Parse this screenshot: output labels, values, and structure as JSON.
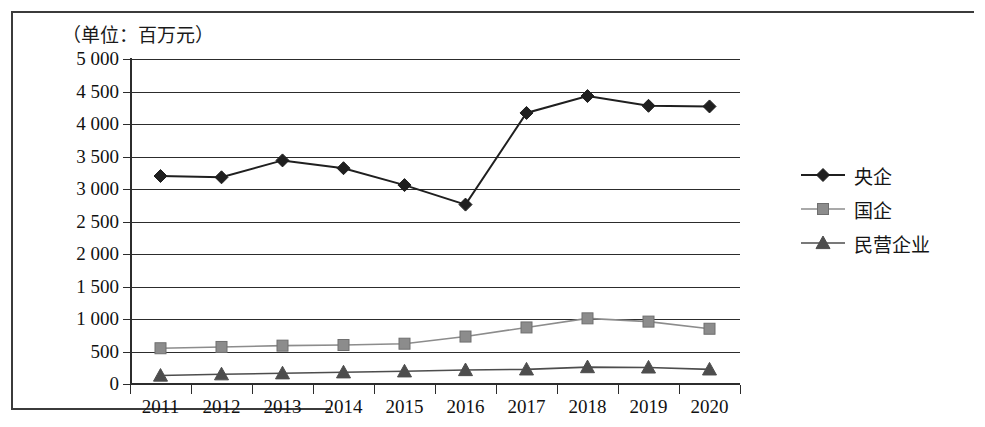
{
  "figure": {
    "unit_label": "（单位：百万元）"
  },
  "legend": {
    "position": "right",
    "items": [
      {
        "label": "央企",
        "marker": "diamond",
        "color": "#1f1f1f"
      },
      {
        "label": "国企",
        "marker": "square",
        "color": "#8c8c8c"
      },
      {
        "label": "民营企业",
        "marker": "triangle",
        "color": "#4d4d4d"
      }
    ]
  },
  "chart_data": {
    "type": "line",
    "title": "",
    "subtitle": "",
    "xlabel": "",
    "ylabel": "",
    "unit_note": "（单位：百万元）",
    "categories": [
      "2011",
      "2012",
      "2013",
      "2014",
      "2015",
      "2016",
      "2017",
      "2018",
      "2019",
      "2020"
    ],
    "ylim": [
      0,
      5000
    ],
    "ytick_values": [
      0,
      500,
      1000,
      1500,
      2000,
      2500,
      3000,
      3500,
      4000,
      4500,
      5000
    ],
    "ytick_labels": [
      "0",
      "500",
      "1 000",
      "1 500",
      "2 000",
      "2 500",
      "3 000",
      "3 500",
      "4 000",
      "4 500",
      "5 000"
    ],
    "grid": true,
    "legend_position": "right",
    "series": [
      {
        "name": "央企",
        "marker": "diamond",
        "color": "#1f1f1f",
        "values": [
          3200,
          3180,
          3440,
          3320,
          3060,
          2760,
          4170,
          4430,
          4280,
          4270
        ]
      },
      {
        "name": "国企",
        "marker": "square",
        "color": "#8c8c8c",
        "values": [
          550,
          570,
          590,
          600,
          620,
          730,
          870,
          1010,
          960,
          850
        ]
      },
      {
        "name": "民营企业",
        "marker": "triangle",
        "color": "#4d4d4d",
        "values": [
          130,
          150,
          165,
          180,
          195,
          215,
          225,
          260,
          255,
          225
        ]
      }
    ]
  }
}
